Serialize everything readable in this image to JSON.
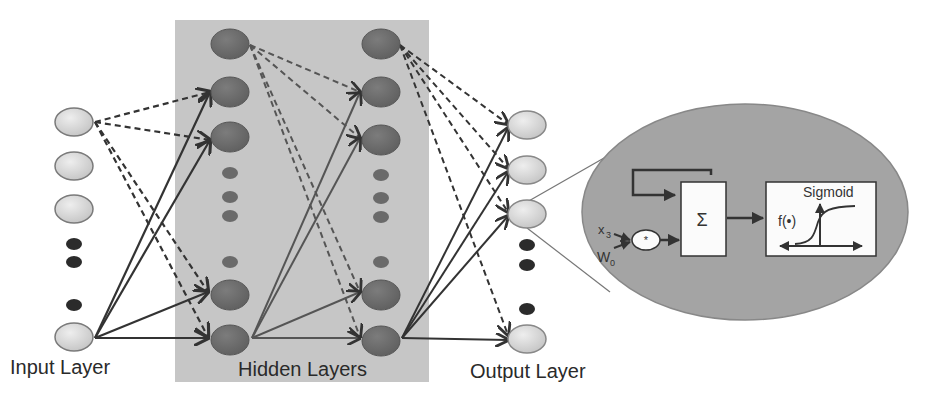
{
  "labels": {
    "input_layer": "Input Layer",
    "hidden_layers": "Hidden Layers",
    "output_layer": "Output Layer"
  },
  "neuron_detail": {
    "input_symbol": "x",
    "input_subscript": "3",
    "weight_symbol": "W",
    "weight_subscript": "0",
    "multiply_symbol": "*",
    "sum_symbol": "Σ",
    "activation_title": "Sigmoid",
    "activation_function": "f(•)"
  },
  "colors": {
    "input_node": "#d6d6d6",
    "hidden_node": "#6e6e6e",
    "output_node": "#c9c9c9",
    "hidden_panel": "#c4c4c4",
    "zoom_ellipse": "#a3a3a3",
    "dot": "#2b2b2b",
    "edge": "#333333"
  }
}
